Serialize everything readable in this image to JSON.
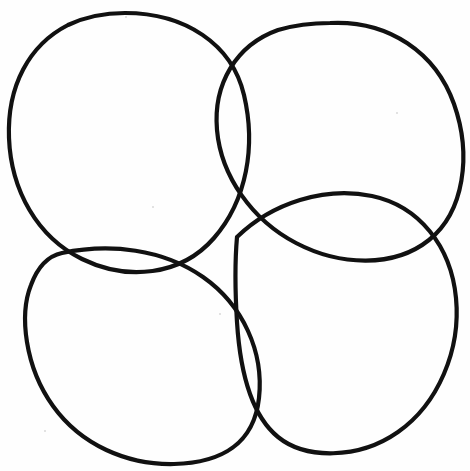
{
  "canvas": {
    "width": 470,
    "height": 471,
    "background_color": "#fefefe",
    "title": "Four overlapping hand-drawn circles"
  },
  "style": {
    "stroke_color": "#111111",
    "stroke_width": 4.2,
    "fill": "none",
    "line_cap": "round"
  },
  "chart_data": {
    "type": "diagram",
    "shapes": [
      {
        "name": "top-left-circle",
        "center_x": 128,
        "center_y": 140,
        "radius_x": 119,
        "radius_y": 128,
        "path": "M 125 13 C 185 13 232 44 244 95 C 256 146 247 200 214 238 C 181 276 127 281 82 259 C 37 237 11 190 9 138 C 7 86 29 45 68 25 C 87 16 106 13 125 13 Z"
      },
      {
        "name": "top-right-circle",
        "center_x": 338,
        "center_y": 137,
        "radius_x": 122,
        "radius_y": 115,
        "path": "M 330 23 C 389 20 436 53 454 104 C 472 155 464 212 429 240 C 394 268 340 266 296 243 C 252 220 221 176 217 130 C 213 84 236 45 278 30 C 295 25 313 23 330 23 Z"
      },
      {
        "name": "bottom-left-circle",
        "center_x": 146,
        "center_y": 353,
        "radius_x": 117,
        "radius_y": 112,
        "path": "M 62 253 C 110 243 163 249 203 277 C 243 305 264 352 259 398 C 254 444 221 463 174 464 C 127 465 81 445 53 406 C 25 367 19 315 31 285 C 38 266 48 256 62 253 Z"
      },
      {
        "name": "bottom-right-circle",
        "center_x": 340,
        "center_y": 330,
        "radius_x": 117,
        "radius_y": 113,
        "path": "M 237 237 C 272 203 325 186 372 196 C 419 206 451 246 456 298 C 461 350 438 404 398 432 C 358 460 305 459 278 437 C 251 415 240 370 237 322 C 235 290 235 260 237 237 Z"
      }
    ],
    "intersections": [
      {
        "name": "center-crossing",
        "x": 234,
        "y": 236
      },
      {
        "name": "top-tangent",
        "x": 237,
        "y": 63
      },
      {
        "name": "left-tangent",
        "x": 62,
        "y": 253
      },
      {
        "name": "right-tangent",
        "x": 432,
        "y": 239
      },
      {
        "name": "bottom-tangent",
        "x": 250,
        "y": 426
      }
    ]
  }
}
